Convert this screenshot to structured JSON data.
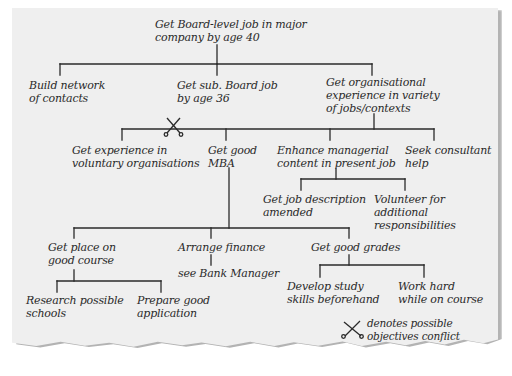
{
  "diagram": {
    "type": "objectives-tree",
    "colors": {
      "background": "#ffffff",
      "paper": "#efefef",
      "shadow": "#9a9a9a",
      "ink": "#2a2a2a"
    },
    "root": {
      "label": "Get Board-level job in major\ncompany by age 40"
    },
    "level1": [
      {
        "label": "Build network\nof contacts"
      },
      {
        "label": "Get sub. Board job\nby age 36"
      },
      {
        "label": "Get organisational\nexperience in variety\nof jobs/contexts"
      }
    ],
    "level2": [
      {
        "label": "Get experience in\nvoluntary organisations"
      },
      {
        "label": "Get good\nMBA"
      },
      {
        "label": "Enhance managerial\ncontent in present job"
      },
      {
        "label": "Seek consultant\nhelp"
      }
    ],
    "managerial_children": [
      {
        "label": "Get job description\namended"
      },
      {
        "label": "Volunteer for\nadditional\nresponsibilities"
      }
    ],
    "mba_children": [
      {
        "label": "Get place on\ngood course"
      },
      {
        "label": "Arrange finance"
      },
      {
        "label": "Get good grades"
      }
    ],
    "course_children": [
      {
        "label": "Research possible\nschools"
      },
      {
        "label": "Prepare good\napplication"
      }
    ],
    "finance_children": [
      {
        "label": "see Bank Manager"
      }
    ],
    "grades_children": [
      {
        "label": "Develop study\nskills beforehand"
      },
      {
        "label": "Work hard\nwhile on course"
      }
    ],
    "conflict_marker": {
      "icon": "scissors-cross-icon",
      "between": [
        "Get experience in voluntary organisations",
        "Get good MBA"
      ]
    },
    "legend": {
      "icon": "scissors-cross-icon",
      "text": "denotes possible\nobjectives conflict"
    }
  }
}
